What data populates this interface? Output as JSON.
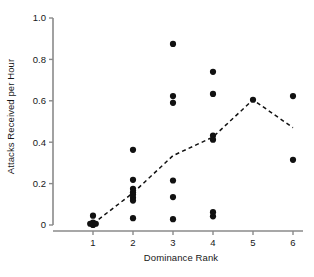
{
  "chart_data": {
    "type": "scatter",
    "title": "",
    "xlabel": "Dominance Rank",
    "ylabel": "Attacks Received per Hour",
    "xlim": [
      0.5,
      6.3
    ],
    "ylim": [
      0,
      1.0
    ],
    "xticks": [
      1,
      2,
      3,
      4,
      5,
      6
    ],
    "xtick_labels": [
      "1",
      "2",
      "3",
      "4",
      "5",
      "6"
    ],
    "yticks": [
      0,
      0.2,
      0.4,
      0.6,
      0.8,
      1.0
    ],
    "ytick_labels": [
      "0",
      "0.2",
      "0.4",
      "0.6",
      "0.8",
      "1.0"
    ],
    "grid": false,
    "legend": null,
    "marker": "filled-circle",
    "marker_color": "#111111",
    "series": [
      {
        "name": "Individual observations",
        "type": "scatter",
        "points": [
          {
            "x": 1,
            "y": 0.045
          },
          {
            "x": 1,
            "y": 0.012
          },
          {
            "x": 1,
            "y": 0.008
          },
          {
            "x": 1,
            "y": 0.004
          },
          {
            "x": 1,
            "y": 0.0
          },
          {
            "x": 0.93,
            "y": 0.006
          },
          {
            "x": 1.07,
            "y": 0.006
          },
          {
            "x": 2,
            "y": 0.363
          },
          {
            "x": 2,
            "y": 0.218
          },
          {
            "x": 2,
            "y": 0.175
          },
          {
            "x": 2,
            "y": 0.158
          },
          {
            "x": 2,
            "y": 0.147
          },
          {
            "x": 2,
            "y": 0.132
          },
          {
            "x": 2,
            "y": 0.118
          },
          {
            "x": 2,
            "y": 0.033
          },
          {
            "x": 3,
            "y": 0.875
          },
          {
            "x": 3,
            "y": 0.623
          },
          {
            "x": 3,
            "y": 0.59
          },
          {
            "x": 3,
            "y": 0.215
          },
          {
            "x": 3,
            "y": 0.135
          },
          {
            "x": 3,
            "y": 0.028
          },
          {
            "x": 4,
            "y": 0.74
          },
          {
            "x": 4,
            "y": 0.633
          },
          {
            "x": 4,
            "y": 0.432
          },
          {
            "x": 4,
            "y": 0.412
          },
          {
            "x": 4,
            "y": 0.062
          },
          {
            "x": 4,
            "y": 0.042
          },
          {
            "x": 5,
            "y": 0.605
          },
          {
            "x": 6,
            "y": 0.623
          },
          {
            "x": 6,
            "y": 0.315
          }
        ]
      },
      {
        "name": "Mean trend",
        "type": "line",
        "linestyle": "dashed",
        "color": "#111111",
        "points": [
          {
            "x": 1,
            "y": 0.006
          },
          {
            "x": 2,
            "y": 0.155
          },
          {
            "x": 3,
            "y": 0.335
          },
          {
            "x": 4,
            "y": 0.425
          },
          {
            "x": 5,
            "y": 0.605
          },
          {
            "x": 6,
            "y": 0.47
          }
        ]
      }
    ]
  },
  "axes": {
    "spine_color": "#8a8a8a",
    "ylabel": "Attacks Received per Hour",
    "xlabel": "Dominance Rank"
  }
}
